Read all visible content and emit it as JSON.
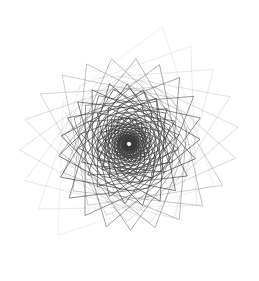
{
  "figure": {
    "type": "generative-geometric-spiral",
    "canvas": {
      "width": 259,
      "height": 281,
      "background_color": "#ffffff"
    },
    "center": {
      "x": 129,
      "y": 144
    },
    "bounds": {
      "x_min": 14,
      "y_min": 18,
      "x_max": 243,
      "y_max": 268
    },
    "winding": "counterclockwise",
    "outer_spike_count": 22,
    "stroke": {
      "color": "#3a3a3a",
      "outer_color": "#b9b9b9",
      "width": 0.7,
      "opacity_inner": 0.92,
      "opacity_outer": 0.3
    },
    "construction": {
      "base_shape": "quadrilateral",
      "vertex_count": 4,
      "iterations": 96,
      "rotation_step_degrees": 16.3,
      "scale_step": 0.9655,
      "initial_radius": 124,
      "shape_skew": 0.28,
      "base_vertex_angles_degrees": [
        -74,
        26,
        128,
        214
      ],
      "base_vertex_radii": [
        1.0,
        0.74,
        0.96,
        0.62
      ]
    }
  }
}
